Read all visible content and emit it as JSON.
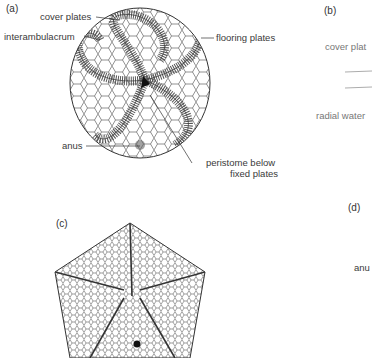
{
  "figure": {
    "panels": [
      {
        "id": "a",
        "label": "(a)",
        "annotations": {
          "cover_plates": "cover plates",
          "interambulacrum": "interambulacrum",
          "flooring_plates": "flooring plates",
          "anus": "anus",
          "peristome_line1": "peristome below",
          "peristome_line2": "fixed plates"
        }
      },
      {
        "id": "b",
        "label": "(b)",
        "annotations": {
          "cover_plates": "cover plat",
          "radial_water": "radial water"
        }
      },
      {
        "id": "c",
        "label": "(c)"
      },
      {
        "id": "d",
        "label": "(d)",
        "annotations": {
          "anus": "anu"
        }
      }
    ],
    "colors": {
      "ink": "#2a2a2a",
      "label": "#3a3a3a",
      "background": "#ffffff"
    }
  }
}
